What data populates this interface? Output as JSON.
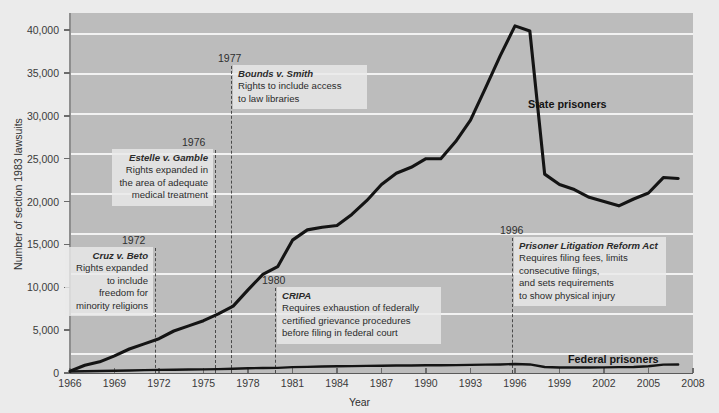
{
  "chart_data": {
    "type": "line",
    "title": "",
    "xlabel": "Year",
    "ylabel": "Number of section 1983 lawsuits",
    "xlim": [
      1966,
      2008
    ],
    "ylim": [
      0,
      42000
    ],
    "grid": true,
    "legend_position": "inline-labels",
    "x_ticks": [
      "1966",
      "1969",
      "1972",
      "1975",
      "1978",
      "1981",
      "1984",
      "1987",
      "1990",
      "1993",
      "1996",
      "1999",
      "2002",
      "2005",
      "2008"
    ],
    "y_ticks": [
      "0",
      "5,000",
      "10,000",
      "15,000",
      "20,000",
      "25,000",
      "30,000",
      "35,000",
      "40,000"
    ],
    "x": [
      1966,
      1967,
      1968,
      1969,
      1970,
      1971,
      1972,
      1973,
      1974,
      1975,
      1976,
      1977,
      1978,
      1979,
      1980,
      1981,
      1982,
      1983,
      1984,
      1985,
      1986,
      1987,
      1988,
      1989,
      1990,
      1991,
      1992,
      1993,
      1994,
      1995,
      1996,
      1997,
      1998,
      1999,
      2000,
      2001,
      2002,
      2003,
      2004,
      2005,
      2006,
      2007
    ],
    "series": [
      {
        "name": "State prisoners",
        "values": [
          218,
          900,
          1300,
          2000,
          2800,
          3400,
          4000,
          4900,
          5500,
          6100,
          6900,
          7800,
          9700,
          11500,
          12400,
          15500,
          16700,
          17000,
          17200,
          18500,
          20100,
          22000,
          23300,
          24000,
          25000,
          25000,
          27000,
          29500,
          33200,
          37000,
          40500,
          39900,
          23200,
          22000,
          21400,
          20500,
          20000,
          19500,
          20300,
          21000,
          22800,
          22700
        ]
      },
      {
        "name": "Federal prisoners",
        "values": [
          180,
          200,
          230,
          260,
          300,
          330,
          360,
          380,
          400,
          420,
          450,
          500,
          560,
          580,
          600,
          680,
          720,
          750,
          780,
          800,
          830,
          850,
          870,
          880,
          900,
          900,
          920,
          950,
          980,
          1000,
          1050,
          1000,
          700,
          650,
          640,
          650,
          660,
          680,
          700,
          780,
          980,
          1000
        ]
      }
    ],
    "series_labels": [
      {
        "text": "State prisoners",
        "x_px": 528,
        "y_px": 98
      },
      {
        "text": "Federal prisoners",
        "x_px": 568,
        "y_px": 353
      }
    ],
    "annotations": [
      {
        "id": "cruz-v-beto",
        "year": "1972",
        "case": "Cruz v. Beto",
        "lines": [
          "Rights expanded",
          "to include",
          "freedom for",
          "minority religions"
        ],
        "align": "right",
        "line_x_px": 155,
        "line_y_top_px": 248,
        "line_y_bottom_px": 373,
        "year_label_x_px": 122,
        "year_label_y_px": 234,
        "box_right_px": 153,
        "box_top_px": 247,
        "box_width_px": 88
      },
      {
        "id": "estelle-v-gamble",
        "year": "1976",
        "case": "Estelle v. Gamble",
        "lines": [
          "Rights expanded in",
          "the area of adequate",
          "medical treatment"
        ],
        "align": "right",
        "line_x_px": 215,
        "line_y_top_px": 150,
        "line_y_bottom_px": 373,
        "year_label_x_px": 182,
        "year_label_y_px": 136,
        "box_right_px": 213,
        "box_top_px": 149,
        "box_width_px": 101
      },
      {
        "id": "bounds-v-smith",
        "year": "1977",
        "case": "Bounds v. Smith",
        "lines": [
          "Rights to include access",
          "to law libraries"
        ],
        "align": "left",
        "line_x_px": 231,
        "line_y_top_px": 66,
        "line_y_bottom_px": 373,
        "year_label_x_px": 218,
        "year_label_y_px": 52,
        "box_left_px": 233,
        "box_top_px": 65,
        "box_width_px": 134
      },
      {
        "id": "cripa",
        "year": "1980",
        "case": "CRIPA",
        "lines": [
          "Requires exhaustion of federally",
          "certified grievance procedures",
          "before filing in federal court"
        ],
        "align": "left",
        "line_x_px": 275,
        "line_y_top_px": 288,
        "line_y_bottom_px": 373,
        "year_label_x_px": 262,
        "year_label_y_px": 274,
        "box_left_px": 277,
        "box_top_px": 287,
        "box_width_px": 164
      },
      {
        "id": "prisoner-litigation-reform-act",
        "year": "1996",
        "case": "Prisoner Litigation Reform Act",
        "lines": [
          "Requires filing fees, limits",
          "consecutive filings,",
          "and sets requirements",
          "to show physical injury"
        ],
        "align": "left",
        "line_x_px": 512,
        "line_y_top_px": 238,
        "line_y_bottom_px": 373,
        "year_label_x_px": 500,
        "year_label_y_px": 224,
        "box_left_px": 514,
        "box_top_px": 237,
        "box_width_px": 152
      }
    ],
    "colors": {
      "plot_background": "#bcbcbc",
      "page_background": "#ebebeb",
      "gridline": "#f2f2f2",
      "series_line": "#141414",
      "event_line": "#4a4a4a",
      "annotation_box": "#e9e9e9"
    }
  }
}
